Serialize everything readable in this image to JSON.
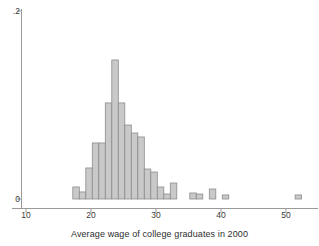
{
  "chart_data": {
    "type": "bar",
    "title": "",
    "xlabel": "Average wage of college graduates in 2000",
    "ylabel": "",
    "xlim": [
      10,
      53
    ],
    "ylim": [
      0,
      0.2
    ],
    "xticks": [
      10,
      20,
      30,
      40,
      50
    ],
    "xtick_labels": [
      "10",
      "20",
      "30",
      "40",
      "50"
    ],
    "yticks": [
      0,
      0.2
    ],
    "ytick_labels": [
      "0",
      ".2"
    ],
    "grid": false,
    "legend": "none",
    "bin_width": 1,
    "bar_fill": "#c9c9c9",
    "bar_stroke": "#8c8c8c",
    "axis_color": "#9a9a9a",
    "bins": [
      {
        "x0": 17.2,
        "x1": 18.2,
        "density": 0.0128
      },
      {
        "x0": 18.2,
        "x1": 19.2,
        "density": 0.0075
      },
      {
        "x0": 19.2,
        "x1": 20.2,
        "density": 0.033
      },
      {
        "x0": 20.2,
        "x1": 21.2,
        "density": 0.0596
      },
      {
        "x0": 21.2,
        "x1": 22.2,
        "density": 0.0596
      },
      {
        "x0": 22.2,
        "x1": 23.2,
        "density": 0.1022
      },
      {
        "x0": 23.2,
        "x1": 24.2,
        "density": 0.1479
      },
      {
        "x0": 24.2,
        "x1": 25.2,
        "density": 0.1022
      },
      {
        "x0": 25.2,
        "x1": 26.2,
        "density": 0.0787
      },
      {
        "x0": 26.2,
        "x1": 27.2,
        "density": 0.0702
      },
      {
        "x0": 27.2,
        "x1": 28.2,
        "density": 0.066
      },
      {
        "x0": 28.2,
        "x1": 29.2,
        "density": 0.0319
      },
      {
        "x0": 29.2,
        "x1": 30.2,
        "density": 0.0287
      },
      {
        "x0": 30.2,
        "x1": 31.2,
        "density": 0.0128
      },
      {
        "x0": 31.2,
        "x1": 32.2,
        "density": 0.0053
      },
      {
        "x0": 32.2,
        "x1": 33.2,
        "density": 0.017
      },
      {
        "x0": 33.2,
        "x1": 34.2,
        "density": 0.0
      },
      {
        "x0": 34.2,
        "x1": 35.2,
        "density": 0.0
      },
      {
        "x0": 35.2,
        "x1": 36.2,
        "density": 0.0064
      },
      {
        "x0": 36.2,
        "x1": 37.2,
        "density": 0.0053
      },
      {
        "x0": 37.2,
        "x1": 38.2,
        "density": 0.0
      },
      {
        "x0": 38.2,
        "x1": 39.2,
        "density": 0.0106
      },
      {
        "x0": 39.2,
        "x1": 40.2,
        "density": 0.0
      },
      {
        "x0": 40.2,
        "x1": 41.2,
        "density": 0.0043
      },
      {
        "x0": 51.4,
        "x1": 52.4,
        "density": 0.0043
      }
    ]
  }
}
